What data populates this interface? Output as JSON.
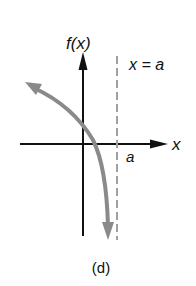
{
  "figure": {
    "y_axis_label": "f(x)",
    "x_axis_label": "x",
    "asymptote_label": "x = a",
    "intercept_label": "a",
    "caption": "(d)"
  },
  "colors": {
    "axes": "#111111",
    "curve": "#8a8a8a",
    "asymptote": "#a0a0a0",
    "background": "#ffffff"
  }
}
